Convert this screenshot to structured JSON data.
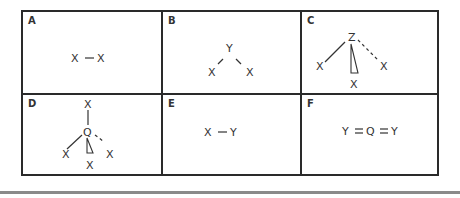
{
  "figure": {
    "panels": [
      {
        "id": "A",
        "label": "A",
        "formula": "X − X",
        "geometry": "linear diatomic",
        "atoms": {
          "left": "X",
          "bond": "−",
          "right": "X"
        }
      },
      {
        "id": "B",
        "label": "B",
        "formula": "bent",
        "geometry": "bent",
        "atoms": {
          "center": "Y",
          "left": "X",
          "right": "X"
        }
      },
      {
        "id": "C",
        "label": "C",
        "formula": "ZX3",
        "geometry": "trigonal pyramidal",
        "atoms": {
          "center": "Z",
          "left": "X",
          "right": "X",
          "bottom": "X"
        }
      },
      {
        "id": "D",
        "label": "D",
        "formula": "QX4",
        "geometry": "tetrahedral",
        "atoms": {
          "center": "Q",
          "top": "X",
          "left": "X",
          "right": "X",
          "bottom": "X"
        }
      },
      {
        "id": "E",
        "label": "E",
        "formula": "X − Y",
        "geometry": "linear diatomic",
        "atoms": {
          "left": "X",
          "bond": "−",
          "right": "Y"
        }
      },
      {
        "id": "F",
        "label": "F",
        "formula": "Y = Q = Y",
        "geometry": "linear triatomic",
        "atoms": {
          "left": "Y",
          "bond1": "=",
          "center": "Q",
          "bond2": "=",
          "right": "Y"
        }
      }
    ],
    "colors": {
      "border": "#2a2a2a",
      "text": "#333333",
      "rule": "#8a8a8a"
    }
  }
}
